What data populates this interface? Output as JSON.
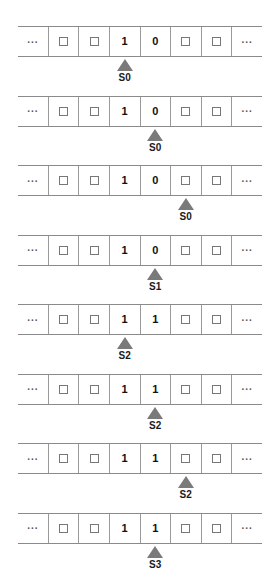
{
  "diagram": {
    "tape_cell_count": 8,
    "blank_symbol": "□",
    "ellipsis_symbol": "...",
    "arrow_color": "#7a7a7a",
    "tape_border_color": "#8a8a8a",
    "steps": [
      {
        "cells": [
          "...",
          "blank",
          "blank",
          "1",
          "0",
          "blank",
          "blank",
          "..."
        ],
        "head_index": 3,
        "state": "S0"
      },
      {
        "cells": [
          "...",
          "blank",
          "blank",
          "1",
          "0",
          "blank",
          "blank",
          "..."
        ],
        "head_index": 4,
        "state": "S0"
      },
      {
        "cells": [
          "...",
          "blank",
          "blank",
          "1",
          "0",
          "blank",
          "blank",
          "..."
        ],
        "head_index": 5,
        "state": "S0"
      },
      {
        "cells": [
          "...",
          "blank",
          "blank",
          "1",
          "0",
          "blank",
          "blank",
          "..."
        ],
        "head_index": 4,
        "state": "S1"
      },
      {
        "cells": [
          "...",
          "blank",
          "blank",
          "1",
          "1",
          "blank",
          "blank",
          "..."
        ],
        "head_index": 3,
        "state": "S2"
      },
      {
        "cells": [
          "...",
          "blank",
          "blank",
          "1",
          "1",
          "blank",
          "blank",
          "..."
        ],
        "head_index": 4,
        "state": "S2"
      },
      {
        "cells": [
          "...",
          "blank",
          "blank",
          "1",
          "1",
          "blank",
          "blank",
          "..."
        ],
        "head_index": 5,
        "state": "S2"
      },
      {
        "cells": [
          "...",
          "blank",
          "blank",
          "1",
          "1",
          "blank",
          "blank",
          "..."
        ],
        "head_index": 4,
        "state": "S3"
      }
    ]
  }
}
